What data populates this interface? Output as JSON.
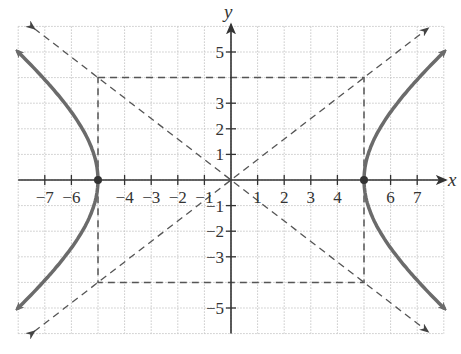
{
  "figure": {
    "type": "hyperbola-graph",
    "equation_implied": "x^2/25 - y^2/16 = 1",
    "axes": {
      "x_label": "x",
      "y_label": "y",
      "x_ticks": [
        "-7",
        "-6",
        "-4",
        "-3",
        "-2",
        "-1",
        "1",
        "2",
        "3",
        "4",
        "6",
        "7"
      ],
      "x_tick_values": [
        -7,
        -6,
        -4,
        -3,
        -2,
        -1,
        1,
        2,
        3,
        4,
        6,
        7
      ],
      "y_ticks": [
        "5",
        "3",
        "2",
        "1",
        "-1",
        "-2",
        "-3",
        "-5"
      ],
      "y_tick_values": [
        5,
        3,
        2,
        1,
        -1,
        -2,
        -3,
        -5
      ],
      "x_range": [
        -8,
        8
      ],
      "y_range": [
        -6,
        6
      ],
      "grid": true
    },
    "vertices": [
      [
        -5,
        0
      ],
      [
        5,
        0
      ]
    ],
    "asymptotes": [
      "y = 4/5 x",
      "y = -4/5 x"
    ],
    "central_rectangle": {
      "x": [
        -5,
        5
      ],
      "y": [
        -4,
        4
      ]
    },
    "colors": {
      "curve": "#6b6b6b",
      "axis": "#333333",
      "dashed": "#555555",
      "grid": "#c8c8c8"
    }
  }
}
